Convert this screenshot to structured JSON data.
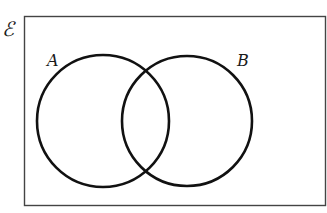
{
  "diagram": {
    "type": "venn",
    "universal_set_label": "ℰ",
    "sets": [
      {
        "label": "A",
        "cx": 103,
        "cy": 121,
        "r": 66
      },
      {
        "label": "B",
        "cx": 187,
        "cy": 121,
        "r": 65
      }
    ],
    "colors": {
      "stroke": "#111111",
      "background": "#ffffff"
    }
  }
}
